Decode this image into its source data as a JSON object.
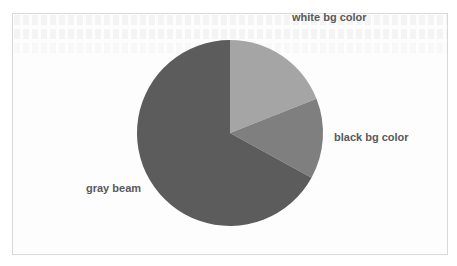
{
  "chart_data": {
    "type": "pie",
    "title": "",
    "categories": [
      "white bg color",
      "black bg color",
      "gray beam"
    ],
    "values": [
      19,
      14,
      67
    ],
    "colors": [
      "#a5a5a5",
      "#7f7f7f",
      "#5c5c5c"
    ],
    "start_angle_deg": 0,
    "direction": "clockwise",
    "legend": "none",
    "data_labels": "category names outside slices"
  },
  "labels": {
    "white": "white bg color",
    "black": "black bg color",
    "gray": "gray beam"
  },
  "style": {
    "label_color": "#595959",
    "frame_border": "#d9d9d9"
  }
}
